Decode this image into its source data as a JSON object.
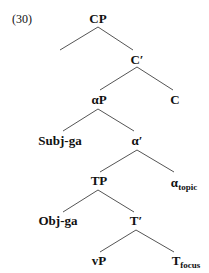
{
  "example_number": "(30)",
  "tree": {
    "nodes": {
      "cp": "CP",
      "c_bar": "C′",
      "alpha_p": "αP",
      "c": "C",
      "subj_ga": "Subj-ga",
      "alpha_bar": "α′",
      "tp": "TP",
      "alpha_topic": {
        "base": "α",
        "sub": "topic"
      },
      "obj_ga": "Obj-ga",
      "t_bar": "T′",
      "vp": "vP",
      "t_focus": {
        "base": "T",
        "sub": "focus"
      }
    },
    "edges": [
      [
        "CP",
        "(unlabeled left branch)"
      ],
      [
        "CP",
        "C′"
      ],
      [
        "C′",
        "αP"
      ],
      [
        "C′",
        "C"
      ],
      [
        "αP",
        "Subj-ga"
      ],
      [
        "αP",
        "α′"
      ],
      [
        "α′",
        "TP"
      ],
      [
        "α′",
        "α_topic"
      ],
      [
        "TP",
        "Obj-ga"
      ],
      [
        "TP",
        "T′"
      ],
      [
        "T′",
        "vP"
      ],
      [
        "T′",
        "T_focus"
      ]
    ]
  }
}
